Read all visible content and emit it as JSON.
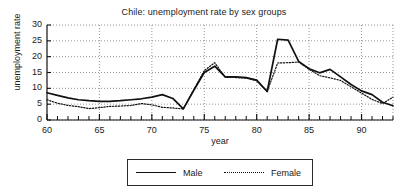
{
  "chart_data": {
    "type": "line",
    "title": "Chile: unemployment rate by sex groups",
    "xlabel": "year",
    "ylabel": "unemployment rate",
    "xlim": [
      60,
      93
    ],
    "ylim": [
      0,
      30
    ],
    "yticks": [
      "0",
      "5",
      "10",
      "15",
      "20",
      "25",
      "30"
    ],
    "ytick_values": [
      0,
      5,
      10,
      15,
      20,
      25,
      30
    ],
    "xticks": [
      "60",
      "65",
      "70",
      "75",
      "80",
      "85",
      "90"
    ],
    "xtick_values": [
      60,
      65,
      70,
      75,
      80,
      85,
      90
    ],
    "grid": "dotted horizontal and vertical gridlines at major ticks",
    "minor_ticks": "every 1 year on x axis",
    "legend_position": "below plot, centered, boxed",
    "x": [
      60,
      61,
      62,
      63,
      64,
      65,
      66,
      67,
      68,
      69,
      70,
      71,
      72,
      73,
      74,
      75,
      76,
      77,
      78,
      79,
      80,
      81,
      82,
      83,
      84,
      85,
      86,
      87,
      88,
      89,
      90,
      91,
      92,
      93
    ],
    "series": [
      {
        "name": "Male",
        "style": "solid",
        "values": [
          8.6,
          7.8,
          7.0,
          6.4,
          6.1,
          5.9,
          5.9,
          6.1,
          6.4,
          6.7,
          7.2,
          8.0,
          6.8,
          3.5,
          9.4,
          15.0,
          17.0,
          13.6,
          13.6,
          13.4,
          12.6,
          9.0,
          25.5,
          25.2,
          18.5,
          16.2,
          14.9,
          16.0,
          13.6,
          11.2,
          9.2,
          8.0,
          5.6,
          4.5
        ]
      },
      {
        "name": "Female",
        "style": "dotted",
        "values": [
          6.4,
          5.3,
          4.6,
          4.2,
          3.6,
          3.9,
          4.3,
          4.4,
          4.6,
          5.2,
          4.8,
          4.0,
          3.8,
          3.5,
          9.6,
          15.6,
          18.1,
          13.5,
          13.4,
          13.2,
          12.4,
          9.0,
          18.0,
          18.1,
          18.3,
          16.0,
          14.0,
          13.3,
          12.5,
          10.5,
          8.5,
          6.5,
          5.2,
          7.2
        ]
      }
    ]
  },
  "legend": {
    "male_label": "Male",
    "female_label": "Female"
  }
}
